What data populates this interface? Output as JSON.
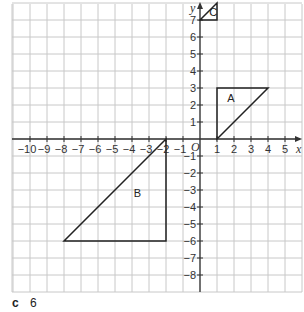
{
  "grid": {
    "x_min": -11,
    "x_max": 6,
    "y_min": -9,
    "y_max": 8,
    "origin_px": [
      200,
      139
    ],
    "unit_px": 17,
    "x_ticks": [
      -10,
      -9,
      -8,
      -7,
      -6,
      -5,
      -4,
      -3,
      -2,
      -1,
      1,
      2,
      3,
      4,
      5
    ],
    "y_ticks": [
      7,
      6,
      5,
      4,
      3,
      2,
      1,
      -1,
      -2,
      -3,
      -4,
      -5,
      -6,
      -7,
      -8
    ],
    "x_label": "x",
    "y_label": "y",
    "origin_label": "O",
    "grid_color": "#c8c8c8",
    "axis_color": "#333333"
  },
  "shapes": [
    {
      "label": "A",
      "vertices": [
        [
          1,
          0
        ],
        [
          1,
          3
        ],
        [
          4,
          3
        ]
      ],
      "label_pos": [
        1.6,
        2.2
      ]
    },
    {
      "label": "B",
      "vertices": [
        [
          -2,
          0
        ],
        [
          -2,
          -6
        ],
        [
          -8,
          -6
        ]
      ],
      "label_pos": [
        -3.9,
        -3.4
      ]
    },
    {
      "label": "C",
      "vertices": [
        [
          0,
          7
        ],
        [
          1,
          7
        ],
        [
          1,
          8
        ]
      ],
      "label_pos": [
        0.55,
        7.25
      ]
    }
  ],
  "question": {
    "part": "c",
    "answer": "6"
  }
}
